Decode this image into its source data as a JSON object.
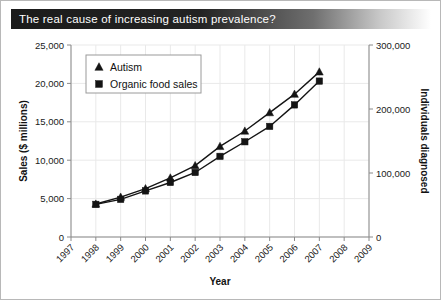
{
  "banner": {
    "title": "The real cause of increasing autism prevalence?",
    "text_color": "#ffffff",
    "gradient_start": "#1b1b1b",
    "gradient_end": "#ffffff"
  },
  "chart_data": {
    "type": "line",
    "title": "The real cause of increasing autism prevalence?",
    "xlabel": "Year",
    "ylabel": "Sales ($ millions)",
    "y2label": "Individuals diagnosed",
    "grid": true,
    "legend_position": "upper-left-inside",
    "x": [
      1998,
      1999,
      2000,
      2001,
      2002,
      2003,
      2004,
      2005,
      2006,
      2007
    ],
    "x_tick_labels": [
      "1997",
      "1998",
      "1999",
      "2000",
      "2001",
      "2002",
      "2003",
      "2004",
      "2005",
      "2006",
      "2007",
      "2008",
      "2009"
    ],
    "xlim": [
      1997,
      2009
    ],
    "ylim": [
      0,
      25000
    ],
    "y_tick_labels": [
      "0",
      "5,000",
      "10,000",
      "15,000",
      "20,000",
      "25,000"
    ],
    "y_ticks": [
      0,
      5000,
      10000,
      15000,
      20000,
      25000
    ],
    "y2lim": [
      0,
      300000
    ],
    "y2_tick_labels": [
      "0",
      "100,000",
      "200,000",
      "300,000"
    ],
    "y2_ticks": [
      0,
      100000,
      200000,
      300000
    ],
    "series": [
      {
        "name": "Autism",
        "marker": "triangle",
        "axis": "right",
        "color": "#141414",
        "values": [
          4300,
          5200,
          6300,
          7700,
          9300,
          11800,
          13800,
          16200,
          18600,
          21500
        ],
        "values_right_axis": [
          51600,
          62400,
          75600,
          92400,
          111600,
          141600,
          165600,
          194400,
          223200,
          258000
        ]
      },
      {
        "name": "Organic food sales",
        "marker": "square",
        "axis": "left",
        "color": "#141414",
        "values": [
          4250,
          4900,
          6000,
          7100,
          8400,
          10500,
          12400,
          14400,
          17200,
          20300
        ]
      }
    ]
  }
}
